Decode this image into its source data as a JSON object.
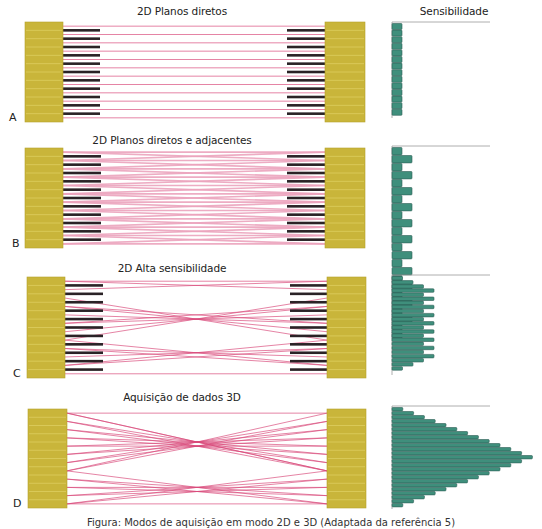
{
  "figure": {
    "sensitivity_label": "Sensibilidade",
    "caption": "Figura: Modos de aquisição em modo 2D e 3D (Adaptada da referência 5)",
    "colors": {
      "crystal": "#c9b53a",
      "crystal_line": "#e3d46a",
      "septa": "#2a2226",
      "lor": "#d9487a",
      "lor_light": "#eba3bd",
      "bar_fill": "#3f8f7c",
      "bar_stroke": "#2e5e55",
      "axis": "#9a9a9a"
    },
    "panels": [
      {
        "id": "A",
        "letter": "A",
        "title": "2D Planos diretos",
        "title_pos": [
          182,
          12
        ],
        "top": 22,
        "bottom": 122,
        "left_block": [
          25,
          63
        ],
        "right_block": [
          325,
          365
        ],
        "septa": true,
        "septa_left": [
          63,
          100
        ],
        "septa_right": [
          287,
          325
        ],
        "mode": "direct",
        "rings": 12,
        "histogram": {
          "x": 392,
          "axis_top": 22,
          "axis_len": 96,
          "bar_h": 6.6,
          "values": [
            1,
            1,
            1,
            1,
            1,
            1,
            1,
            1,
            1,
            1,
            1,
            1,
            1,
            1
          ],
          "unit": 10
        }
      },
      {
        "id": "B",
        "letter": "B",
        "title": "2D Planos diretos e adjacentes",
        "title_pos": [
          172,
          140
        ],
        "top": 148,
        "bottom": 248,
        "left_block": [
          25,
          63
        ],
        "right_block": [
          325,
          365
        ],
        "septa": true,
        "septa_left": [
          63,
          101
        ],
        "septa_right": [
          287,
          325
        ],
        "mode": "adjacent",
        "rings": 12,
        "histogram": {
          "x": 392,
          "axis_top": 146,
          "axis_len": 102,
          "bar_h": 8.0,
          "values": [
            1,
            2,
            1,
            2,
            1,
            2,
            1,
            2,
            1,
            2,
            1,
            2,
            1,
            2,
            1,
            2,
            1,
            2,
            1,
            2,
            1,
            2,
            1,
            1
          ],
          "unit": 10
        }
      },
      {
        "id": "C",
        "letter": "C",
        "title": "2D Alta sensibilidade",
        "title_pos": [
          172,
          268
        ],
        "top": 277,
        "bottom": 378,
        "left_block": [
          27,
          65
        ],
        "right_block": [
          327,
          366
        ],
        "septa": true,
        "septa_left": [
          65,
          103
        ],
        "septa_right": [
          290,
          327
        ],
        "mode": "high",
        "rings": 12,
        "histogram": {
          "x": 392,
          "axis_top": 275,
          "axis_len": 100,
          "bar_h": 4.1,
          "values": [
            1,
            2,
            3,
            4,
            3,
            4,
            3,
            4,
            3,
            4,
            3,
            4,
            3,
            4,
            3,
            4,
            3,
            4,
            3,
            4,
            3,
            2,
            1
          ],
          "unit": 10.5
        }
      },
      {
        "id": "D",
        "letter": "D",
        "title": "Aquisição de dados 3D",
        "title_pos": [
          182,
          397
        ],
        "top": 409,
        "bottom": 508,
        "left_block": [
          28,
          67
        ],
        "right_block": [
          327,
          366
        ],
        "septa": false,
        "mode": "3d",
        "rings": 12,
        "histogram": {
          "x": 392,
          "axis_top": 406,
          "axis_len": 103,
          "bar_h": 4.0,
          "values": [
            1,
            2,
            3,
            4,
            5,
            6,
            7,
            8,
            9,
            10,
            11,
            12,
            13,
            12,
            11,
            10,
            9,
            8,
            7,
            6,
            5,
            4,
            3,
            2,
            1
          ],
          "unit": 10.8
        }
      }
    ]
  }
}
